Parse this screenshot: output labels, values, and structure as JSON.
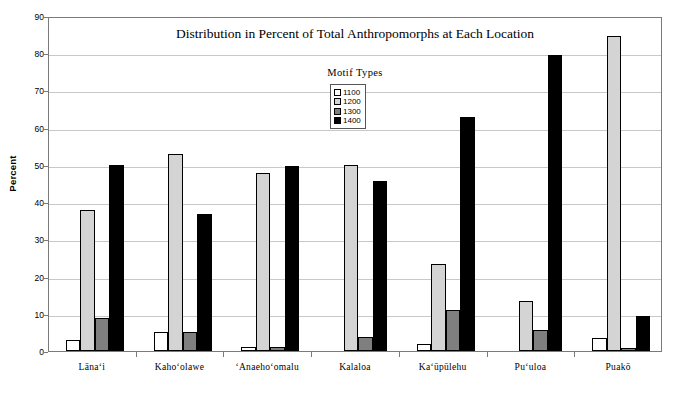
{
  "chart_data": {
    "type": "bar",
    "title": "Distribution in Percent of Total Anthropomorphs at Each Location",
    "xlabel": "",
    "ylabel": "Percent",
    "ylim": [
      0,
      90
    ],
    "ytick_step": 10,
    "yticks": [
      0,
      10,
      20,
      30,
      40,
      50,
      60,
      70,
      80,
      90
    ],
    "grid": "horizontal",
    "legend_position": "inside-top-center",
    "legend_title": "Motif Types",
    "categories": [
      "Lānaʻi",
      "Kahoʻolawe",
      "ʻAnaehoʻomalu",
      "Kalaloa",
      "Kaʻūpūlehu",
      "Puʻuloa",
      "Puakō"
    ],
    "series": [
      {
        "name": "1100",
        "color": "#ffffff",
        "values": [
          3.0,
          5.0,
          1.0,
          0.0,
          2.0,
          0.0,
          3.4
        ]
      },
      {
        "name": "1200",
        "color": "#d4d4d4",
        "values": [
          38.0,
          53.0,
          47.8,
          49.9,
          23.5,
          13.5,
          84.5
        ]
      },
      {
        "name": "1300",
        "color": "#7f7f7f",
        "values": [
          9.0,
          5.0,
          1.0,
          3.7,
          11.0,
          5.6,
          0.7
        ]
      },
      {
        "name": "1400",
        "color": "#000000",
        "values": [
          50.0,
          36.9,
          49.8,
          45.6,
          62.8,
          79.5,
          9.5
        ]
      }
    ]
  }
}
